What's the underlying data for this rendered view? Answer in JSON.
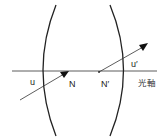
{
  "diagram": {
    "type": "thick-lens-nodal-points",
    "labels": {
      "incoming_ray": "u",
      "outgoing_ray": "u′",
      "nodal_point_front": "N",
      "nodal_point_rear": "N′",
      "optical_axis": "光軸"
    },
    "colors": {
      "line": "#222222",
      "background": "#ffffff"
    }
  }
}
